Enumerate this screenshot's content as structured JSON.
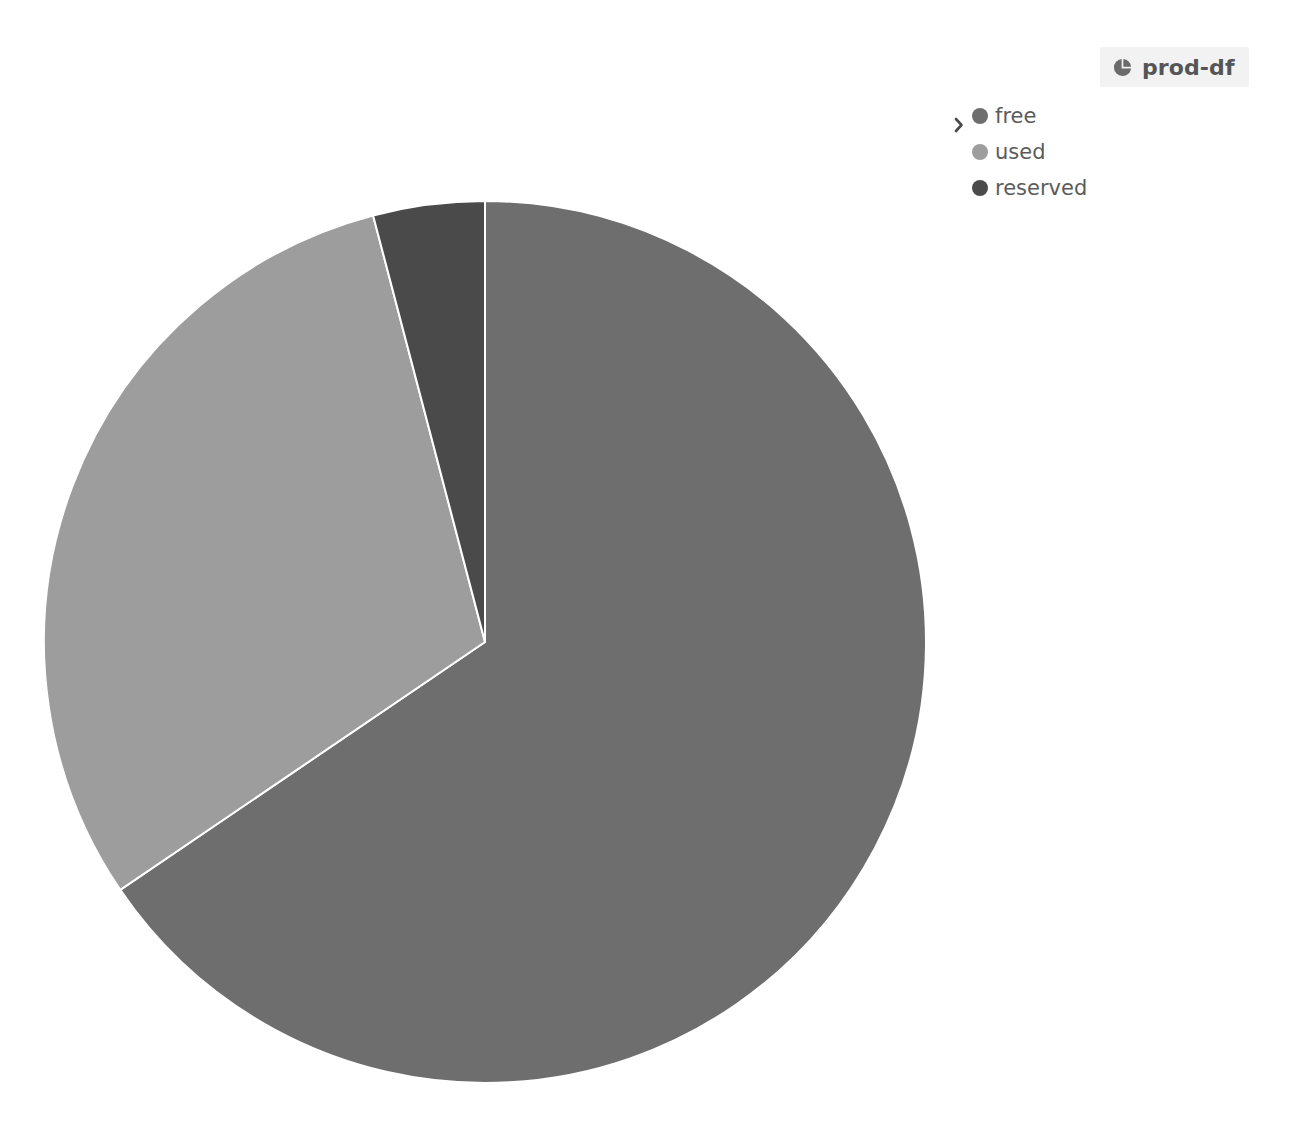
{
  "header": {
    "title": "prod-df",
    "icon": "pie-chart-icon",
    "badge_background": "#f2f2f2",
    "text_color": "#555555"
  },
  "legend": {
    "expander_icon": "chevron-right-icon",
    "position": "top-right",
    "items": [
      {
        "label": "free",
        "color": "#6e6e6e"
      },
      {
        "label": "used",
        "color": "#9d9d9d"
      },
      {
        "label": "reserved",
        "color": "#4a4a4a"
      }
    ]
  },
  "chart_data": {
    "type": "pie",
    "title": "prod-df",
    "xlabel": "",
    "ylabel": "",
    "grid": false,
    "legend_position": "top-right",
    "start_angle_deg": 0,
    "direction": "clockwise",
    "slice_border_color": "#ffffff",
    "categories": [
      "free",
      "used",
      "reserved"
    ],
    "values": [
      65.5,
      30.4,
      4.1
    ],
    "unit": "%",
    "colors": [
      "#6e6e6e",
      "#9d9d9d",
      "#4a4a4a"
    ],
    "slices": [
      {
        "label": "free",
        "value": 65.5,
        "color": "#6e6e6e",
        "start_deg": 0.0,
        "end_deg": 235.8
      },
      {
        "label": "used",
        "value": 30.4,
        "color": "#9d9d9d",
        "start_deg": 235.8,
        "end_deg": 345.3
      },
      {
        "label": "reserved",
        "value": 4.1,
        "color": "#4a4a4a",
        "start_deg": 345.3,
        "end_deg": 360.0
      }
    ],
    "geometry": {
      "center_x": 441,
      "center_y": 441,
      "radius": 441
    }
  }
}
